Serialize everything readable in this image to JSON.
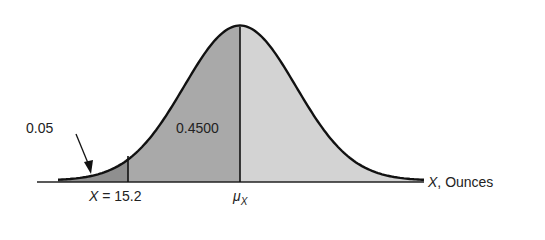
{
  "chart_data": {
    "type": "area",
    "title": "",
    "distribution": "normal",
    "xlabel_var": "X",
    "xlabel_unit": "Ounces",
    "xlabel": "X, Ounces",
    "ylabel": "",
    "mean_label": "μ",
    "mean_subscript": "X",
    "cutoff_label_var": "X",
    "cutoff_label_value": "= 15.2",
    "cutoff_value": 15.2,
    "regions": [
      {
        "name": "left-tail",
        "area": 0.05,
        "label": "0.05",
        "from": "-inf",
        "to": 15.2,
        "color": "#8f8f8f"
      },
      {
        "name": "cutoff-to-mean",
        "area": 0.45,
        "label": "0.4500",
        "from": 15.2,
        "to": "μX",
        "color": "#a9a9a9"
      },
      {
        "name": "right-half",
        "area": 0.5,
        "label": "",
        "from": "μX",
        "to": "+inf",
        "color": "#d3d3d3"
      }
    ],
    "grid": false,
    "legend": "none"
  }
}
